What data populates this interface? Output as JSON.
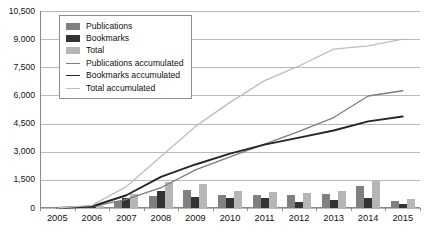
{
  "chart_data": {
    "type": "bar",
    "title": "",
    "xlabel": "",
    "ylabel": "",
    "ylim": [
      0,
      10500
    ],
    "ytick_step": 1500,
    "grid": true,
    "legend_position": "top-left",
    "categories": [
      "2005",
      "2006",
      "2007",
      "2008",
      "2009",
      "2010",
      "2011",
      "2012",
      "2013",
      "2014",
      "2015"
    ],
    "ytick_labels": [
      "0",
      "1,500",
      "3,000",
      "4,500",
      "6,000",
      "7,500",
      "9,000",
      "10,500"
    ],
    "ytick_values": [
      0,
      1500,
      3000,
      4500,
      6000,
      7500,
      9000,
      10500
    ],
    "series": [
      {
        "name": "Publications",
        "kind": "bar",
        "color": "#808080",
        "values": [
          0,
          60,
          400,
          620,
          950,
          700,
          680,
          670,
          740,
          1150,
          360
        ]
      },
      {
        "name": "Bookmarks",
        "kind": "bar",
        "color": "#333333",
        "values": [
          0,
          30,
          550,
          900,
          590,
          510,
          560,
          320,
          420,
          560,
          200
        ]
      },
      {
        "name": "Total",
        "kind": "bar",
        "color": "#b6b6b6",
        "values": [
          0,
          90,
          750,
          1400,
          1280,
          900,
          870,
          780,
          900,
          1460,
          500
        ]
      },
      {
        "name": "Publications accumulated",
        "kind": "line",
        "color": "#7d7d7d",
        "values": [
          0,
          60,
          460,
          1080,
          2030,
          2730,
          3410,
          4080,
          4820,
          5970,
          6250
        ]
      },
      {
        "name": "Bookmarks accumulated",
        "kind": "line",
        "color": "#262626",
        "values": [
          0,
          80,
          680,
          1660,
          2320,
          2900,
          3380,
          3750,
          4130,
          4620,
          4880
        ]
      },
      {
        "name": "Total accumulated",
        "kind": "line",
        "color": "#bdbdbd",
        "values": [
          0,
          140,
          1140,
          2740,
          4350,
          5630,
          6790,
          7570,
          8470,
          8640,
          9000
        ]
      }
    ]
  },
  "legend": {
    "items": [
      {
        "label": "Publications",
        "swatch": "pub"
      },
      {
        "label": "Bookmarks",
        "swatch": "bm"
      },
      {
        "label": "Total",
        "swatch": "tot"
      },
      {
        "label": "Publications accumulated",
        "swatch": "l-pub"
      },
      {
        "label": "Bookmarks accumulated",
        "swatch": "l-bm"
      },
      {
        "label": "Total accumulated",
        "swatch": "l-tot"
      }
    ]
  }
}
